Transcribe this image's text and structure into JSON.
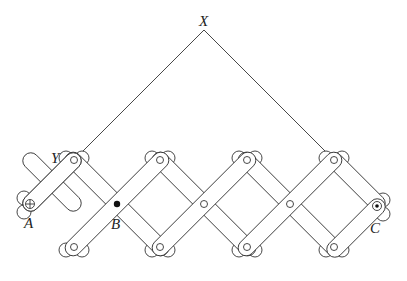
{
  "diagram": {
    "type": "pantograph-linkage",
    "labels": {
      "X": "X",
      "Y": "Y",
      "A": "A",
      "B": "B",
      "C": "C"
    },
    "points": {
      "X": [
        204,
        30
      ],
      "Y": [
        74,
        160
      ],
      "A": [
        30,
        204
      ],
      "B": [
        117,
        204
      ],
      "C": [
        377,
        206
      ]
    },
    "top_pivots": [
      [
        74,
        160
      ],
      [
        160,
        160
      ],
      [
        247,
        160
      ],
      [
        334,
        160
      ]
    ],
    "middle_pivots": [
      [
        117,
        204
      ],
      [
        204,
        204
      ],
      [
        290,
        204
      ]
    ],
    "bottom_pivots": [
      [
        74,
        247
      ],
      [
        160,
        247
      ],
      [
        247,
        247
      ],
      [
        334,
        247
      ]
    ],
    "colors": {
      "stroke": "#333333",
      "background": "#ffffff"
    }
  }
}
